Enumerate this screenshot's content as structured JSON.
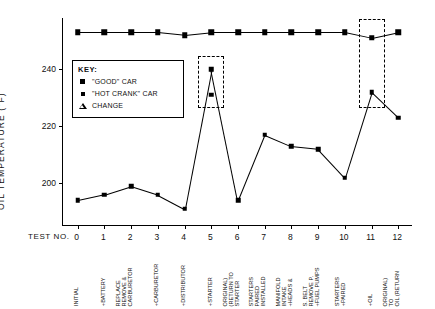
{
  "chart_data": {
    "type": "line",
    "title": "",
    "ylabel": "OIL TEMPERATURE (°F)",
    "xlabel": "TEST NO.",
    "ylim": [
      185,
      258
    ],
    "yticks": [
      200,
      220,
      240
    ],
    "ytick_labels": [
      "200",
      "220",
      "240"
    ],
    "grid": false,
    "x": [
      0,
      1,
      2,
      3,
      4,
      5,
      6,
      7,
      8,
      9,
      10,
      11,
      12
    ],
    "xtick_labels": [
      "0",
      "1",
      "2",
      "3",
      "4",
      "5",
      "6",
      "7",
      "8",
      "9",
      "10",
      "11",
      "12"
    ],
    "x_categories": [
      "INITIAL",
      "+BATTERY",
      "CARBURETOR REMOVE & REPLACE",
      "+CARBURETOR",
      "+DISTRIBUTOR",
      "+STARTER",
      "STARTER (RETURN TO ORIGINAL)",
      "INSTALLED PAIRED STARTERS",
      "+HEADS & INTAKE MANIFOLD",
      "+FUEL PUMPS REMOVE P. S. BELT",
      "+PAIRED STARTERS",
      "+OIL",
      "OIL (RETURN TO ORIGINAL)"
    ],
    "series": [
      {
        "name": "\"GOOD\" CAR",
        "marker": "filled-square-large",
        "values": [
          253,
          253,
          253,
          253,
          252,
          253,
          253,
          253,
          253,
          253,
          253,
          251,
          253
        ],
        "note": "upper trace, flat near 253°F; point at test 11 sits slightly higher in dashed box"
      },
      {
        "name": "\"HOT CRANK\" CAR",
        "marker": "filled-square-small",
        "values": [
          194,
          196,
          199,
          196,
          191,
          240,
          194,
          217,
          213,
          212,
          202,
          232,
          223
        ],
        "note": "lower trace; test 5 jumps to 240 then a second point at 231 in dashed box"
      }
    ],
    "extra_points": [
      {
        "x": 5,
        "y": 231,
        "series": "\"HOT CRANK\" CAR",
        "note": "second reading at test 5 inside dashed box"
      }
    ],
    "annotations": [
      {
        "type": "dashed-box",
        "x_center": 5,
        "y_range": [
          228,
          243
        ],
        "note": "highlights test 5 hot-crank readings"
      },
      {
        "type": "dashed-box",
        "x_center": 11,
        "y_range": [
          228,
          256
        ],
        "note": "highlights test 11 readings"
      }
    ],
    "legend": {
      "title": "KEY:",
      "position": "inside-upper-left",
      "entries": [
        {
          "label": "\"GOOD\" CAR",
          "marker": "filled-square-large"
        },
        {
          "label": "\"HOT CRANK\" CAR",
          "marker": "filled-square-small"
        },
        {
          "label": "CHANGE",
          "marker": "open-triangle"
        }
      ]
    }
  }
}
